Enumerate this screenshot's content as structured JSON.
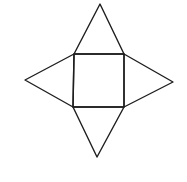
{
  "diagram": {
    "stroke_color": "#1e1e1e",
    "background": "#ffffff",
    "stroke_width": 1.4,
    "square": {
      "points": [
        [
          74,
          54
        ],
        [
          124,
          54
        ],
        [
          124,
          107
        ],
        [
          73,
          107
        ]
      ]
    },
    "triangles": [
      {
        "name": "top",
        "points": [
          [
            74,
            54
          ],
          [
            100,
            4
          ],
          [
            124,
            54
          ]
        ]
      },
      {
        "name": "left",
        "points": [
          [
            74,
            54
          ],
          [
            25,
            80
          ],
          [
            73,
            107
          ]
        ]
      },
      {
        "name": "right",
        "points": [
          [
            124,
            54
          ],
          [
            173,
            82
          ],
          [
            124,
            107
          ]
        ]
      },
      {
        "name": "bottom",
        "points": [
          [
            73,
            107
          ],
          [
            97,
            157
          ],
          [
            124,
            107
          ]
        ]
      }
    ]
  }
}
